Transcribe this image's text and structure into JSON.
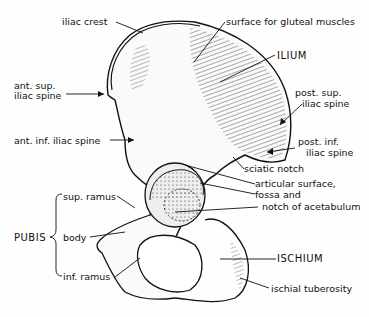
{
  "diagram": {
    "labels": {
      "iliac_crest": "iliac crest",
      "gluteal_surface": "surface for gluteal muscles",
      "ilium": "ILIUM",
      "ant_sup_1": "ant. sup.",
      "ant_sup_2": "iliac spine",
      "post_sup_1": "post. sup.",
      "post_sup_2": "iliac spine",
      "ant_inf": "ant. inf. iliac spine",
      "post_inf_1": "post. inf.",
      "post_inf_2": "iliac spine",
      "sciatic_notch": "sciatic notch",
      "articular_1": "articular surface,",
      "articular_2": "fossa and",
      "articular_3": "notch of acetabulum",
      "sup_ramus": "sup. ramus",
      "pubis": "PUBIS",
      "body": "body",
      "inf_ramus": "inf. ramus",
      "ischium": "ISCHIUM",
      "ischial_tuberosity": "ischial tuberosity"
    }
  }
}
